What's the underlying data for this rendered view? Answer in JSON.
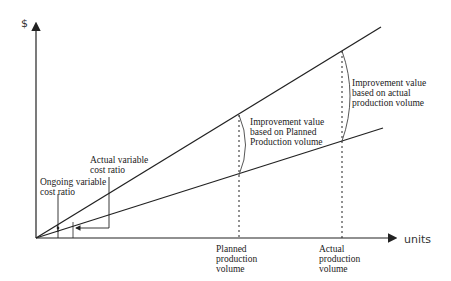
{
  "diagram": {
    "y_axis_label": "$",
    "x_axis_label": "units",
    "lines": [
      {
        "name": "actual-variable-cost-line",
        "start": [
          36,
          238
        ],
        "end": [
          381,
          27
        ]
      },
      {
        "name": "ongoing-variable-cost-line",
        "start": [
          36,
          238
        ],
        "end": [
          383,
          128
        ]
      }
    ],
    "markers": [
      {
        "name": "planned-production-volume",
        "x": 239,
        "label": "Planned\nproduction\nvolume"
      },
      {
        "name": "actual-production-volume",
        "x": 342,
        "label": "Actual\nproduction\nvolume"
      }
    ],
    "annotations": {
      "actual_ratio": "Actual variable\ncost ratio",
      "ongoing_ratio": "Ongoing variable\ncost ratio",
      "improvement_planned": "Improvement value\nbased on Planned\nProduction volume",
      "improvement_actual": "Improvement value\nbased on actual\nproduction volume"
    },
    "colors": {
      "line": "#222222",
      "text": "#222222",
      "background": "#ffffff"
    }
  }
}
